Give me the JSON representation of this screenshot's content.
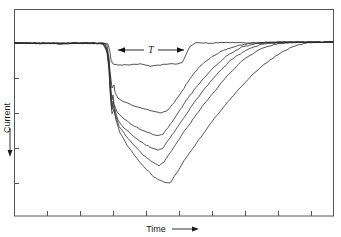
{
  "figure": {
    "background": "#ffffff",
    "line_color": "#2b2b2b",
    "frame_color": "#555555",
    "width": 341,
    "height": 237
  },
  "axes": {
    "y_label": "Current",
    "y_arrow": "down-arrow",
    "x_label": "Time",
    "x_arrow": "right-arrow"
  },
  "annotations": [
    {
      "label": "T",
      "kind": "double-headed-horizontal-arrow",
      "x_start_px": 118,
      "x_end_px": 184,
      "y_px": 50
    }
  ],
  "chart_data": {
    "type": "line",
    "title": "",
    "xlabel": "Time",
    "ylabel": "Current",
    "grid": false,
    "legend": "none",
    "axis_tick_labels": {
      "x": [],
      "y": []
    },
    "x_ticks_px": [
      47,
      80,
      113,
      146,
      179,
      212,
      245,
      278,
      311
    ],
    "y_ticks_px": [
      43,
      78,
      113,
      148,
      183
    ],
    "axis_note": "Unlabeled arbitrary units; current plotted downward (negative deflection), time increasing to the right",
    "plot_frame_px": {
      "left": 14,
      "top": 9,
      "right": 334,
      "bottom": 216
    },
    "baseline_y_px": 43,
    "n_traces": 6,
    "series": [
      {
        "name": "trace-1-shallowest",
        "depth_rank": 1,
        "min_y_px": 67,
        "points_px": [
          [
            15,
            43
          ],
          [
            30,
            43.5
          ],
          [
            45,
            43
          ],
          [
            60,
            44
          ],
          [
            75,
            43
          ],
          [
            90,
            43.5
          ],
          [
            103,
            43
          ],
          [
            108,
            44
          ],
          [
            110,
            52
          ],
          [
            111,
            60
          ],
          [
            113,
            64
          ],
          [
            118,
            65
          ],
          [
            130,
            65
          ],
          [
            140,
            64
          ],
          [
            150,
            66
          ],
          [
            160,
            65
          ],
          [
            168,
            64
          ],
          [
            176,
            64
          ],
          [
            182,
            63
          ],
          [
            186,
            55
          ],
          [
            190,
            46
          ],
          [
            196,
            43
          ],
          [
            210,
            43
          ],
          [
            230,
            42.5
          ],
          [
            250,
            43
          ],
          [
            270,
            42
          ],
          [
            290,
            42
          ],
          [
            310,
            42.5
          ],
          [
            333,
            42
          ]
        ]
      },
      {
        "name": "trace-2",
        "depth_rank": 2,
        "min_y_px": 113,
        "points_px": [
          [
            15,
            43
          ],
          [
            40,
            43.5
          ],
          [
            70,
            43
          ],
          [
            95,
            43.5
          ],
          [
            103,
            43
          ],
          [
            107,
            45
          ],
          [
            109,
            58
          ],
          [
            110,
            72
          ],
          [
            111,
            80
          ],
          [
            112,
            88
          ],
          [
            114,
            85
          ],
          [
            115,
            92
          ],
          [
            118,
            98
          ],
          [
            124,
            102
          ],
          [
            132,
            105
          ],
          [
            142,
            108
          ],
          [
            152,
            111
          ],
          [
            162,
            113
          ],
          [
            168,
            110
          ],
          [
            176,
            100
          ],
          [
            184,
            88
          ],
          [
            192,
            76
          ],
          [
            200,
            66
          ],
          [
            210,
            58
          ],
          [
            222,
            51
          ],
          [
            236,
            46
          ],
          [
            250,
            43.5
          ],
          [
            266,
            42.5
          ],
          [
            285,
            42
          ],
          [
            305,
            42.5
          ],
          [
            333,
            42
          ]
        ]
      },
      {
        "name": "trace-3",
        "depth_rank": 3,
        "min_y_px": 136,
        "points_px": [
          [
            15,
            43
          ],
          [
            50,
            43.5
          ],
          [
            85,
            43
          ],
          [
            100,
            43.5
          ],
          [
            105,
            44
          ],
          [
            108,
            55
          ],
          [
            110,
            75
          ],
          [
            111,
            90
          ],
          [
            112,
            100
          ],
          [
            113,
            95
          ],
          [
            114,
            104
          ],
          [
            117,
            112
          ],
          [
            123,
            118
          ],
          [
            131,
            124
          ],
          [
            140,
            129
          ],
          [
            150,
            133
          ],
          [
            158,
            136
          ],
          [
            163,
            134
          ],
          [
            170,
            125
          ],
          [
            178,
            113
          ],
          [
            186,
            101
          ],
          [
            194,
            90
          ],
          [
            204,
            78
          ],
          [
            215,
            66
          ],
          [
            228,
            55
          ],
          [
            242,
            47
          ],
          [
            258,
            43.5
          ],
          [
            278,
            42.5
          ],
          [
            300,
            42
          ],
          [
            333,
            42
          ]
        ]
      },
      {
        "name": "trace-4",
        "depth_rank": 4,
        "min_y_px": 150,
        "points_px": [
          [
            15,
            43
          ],
          [
            55,
            43.5
          ],
          [
            90,
            43
          ],
          [
            102,
            43.5
          ],
          [
            106,
            46
          ],
          [
            109,
            62
          ],
          [
            110,
            82
          ],
          [
            111,
            96
          ],
          [
            112,
            106
          ],
          [
            113,
            101
          ],
          [
            115,
            110
          ],
          [
            118,
            120
          ],
          [
            124,
            128
          ],
          [
            132,
            135
          ],
          [
            141,
            142
          ],
          [
            150,
            147
          ],
          [
            158,
            150
          ],
          [
            163,
            148
          ],
          [
            170,
            138
          ],
          [
            178,
            126
          ],
          [
            187,
            113
          ],
          [
            196,
            100
          ],
          [
            206,
            87
          ],
          [
            218,
            73
          ],
          [
            231,
            60
          ],
          [
            246,
            50
          ],
          [
            262,
            44
          ],
          [
            282,
            42.5
          ],
          [
            305,
            42
          ],
          [
            333,
            42
          ]
        ]
      },
      {
        "name": "trace-5",
        "depth_rank": 5,
        "min_y_px": 166,
        "points_px": [
          [
            15,
            43
          ],
          [
            60,
            43.5
          ],
          [
            92,
            43
          ],
          [
            103,
            44
          ],
          [
            107,
            50
          ],
          [
            109,
            68
          ],
          [
            110,
            88
          ],
          [
            111,
            100
          ],
          [
            112,
            110
          ],
          [
            113,
            105
          ],
          [
            115,
            114
          ],
          [
            119,
            126
          ],
          [
            126,
            136
          ],
          [
            134,
            145
          ],
          [
            143,
            155
          ],
          [
            152,
            162
          ],
          [
            159,
            166
          ],
          [
            164,
            162
          ],
          [
            172,
            150
          ],
          [
            181,
            136
          ],
          [
            191,
            122
          ],
          [
            202,
            107
          ],
          [
            214,
            92
          ],
          [
            227,
            76
          ],
          [
            242,
            61
          ],
          [
            258,
            50
          ],
          [
            276,
            44
          ],
          [
            296,
            42.5
          ],
          [
            315,
            42
          ],
          [
            333,
            42
          ]
        ]
      },
      {
        "name": "trace-6-deepest",
        "depth_rank": 6,
        "min_y_px": 183,
        "points_px": [
          [
            15,
            43
          ],
          [
            62,
            43.5
          ],
          [
            95,
            43
          ],
          [
            103,
            44
          ],
          [
            107,
            52
          ],
          [
            109,
            70
          ],
          [
            110,
            90
          ],
          [
            111,
            104
          ],
          [
            112,
            114
          ],
          [
            114,
            109
          ],
          [
            116,
            120
          ],
          [
            120,
            133
          ],
          [
            127,
            145
          ],
          [
            135,
            156
          ],
          [
            144,
            167
          ],
          [
            154,
            177
          ],
          [
            163,
            182
          ],
          [
            170,
            183
          ],
          [
            176,
            174
          ],
          [
            184,
            161
          ],
          [
            193,
            148
          ],
          [
            203,
            134
          ],
          [
            214,
            119
          ],
          [
            226,
            104
          ],
          [
            239,
            89
          ],
          [
            252,
            75
          ],
          [
            266,
            63
          ],
          [
            280,
            53
          ],
          [
            294,
            46
          ],
          [
            308,
            43
          ],
          [
            320,
            42.5
          ],
          [
            333,
            42
          ]
        ]
      }
    ]
  }
}
